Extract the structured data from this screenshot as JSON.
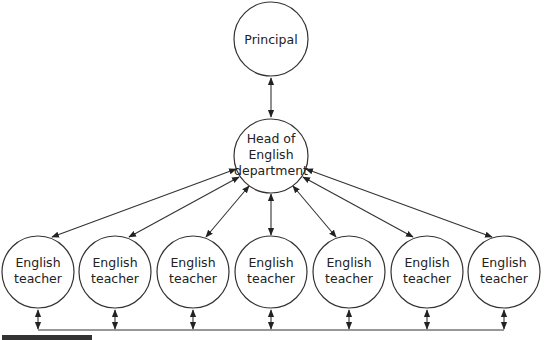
{
  "diagram": {
    "type": "organizational-hierarchy",
    "nodes": {
      "principal": {
        "label_lines": [
          "Principal"
        ]
      },
      "head": {
        "label_lines": [
          "Head of",
          "English",
          "department"
        ]
      },
      "teachers": [
        {
          "label_lines": [
            "English",
            "teacher"
          ]
        },
        {
          "label_lines": [
            "English",
            "teacher"
          ]
        },
        {
          "label_lines": [
            "English",
            "teacher"
          ]
        },
        {
          "label_lines": [
            "English",
            "teacher"
          ]
        },
        {
          "label_lines": [
            "English",
            "teacher"
          ]
        },
        {
          "label_lines": [
            "English",
            "teacher"
          ]
        },
        {
          "label_lines": [
            "English",
            "teacher"
          ]
        }
      ]
    },
    "edges": [
      {
        "from": "principal",
        "to": "head",
        "style": "bidirectional"
      },
      {
        "from": "head",
        "to": "teacher-1",
        "style": "bidirectional"
      },
      {
        "from": "head",
        "to": "teacher-2",
        "style": "bidirectional"
      },
      {
        "from": "head",
        "to": "teacher-3",
        "style": "bidirectional"
      },
      {
        "from": "head",
        "to": "teacher-4",
        "style": "bidirectional"
      },
      {
        "from": "head",
        "to": "teacher-5",
        "style": "bidirectional"
      },
      {
        "from": "head",
        "to": "teacher-6",
        "style": "bidirectional"
      },
      {
        "from": "head",
        "to": "teacher-7",
        "style": "bidirectional"
      },
      {
        "from": "teachers",
        "to": "shared-bottom-line",
        "style": "bidirectional"
      }
    ]
  }
}
